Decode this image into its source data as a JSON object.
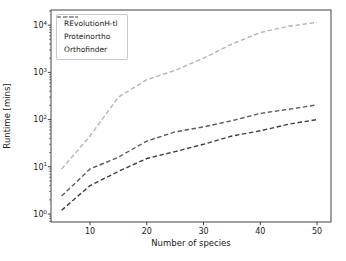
{
  "figure": {
    "background": "#ffffff",
    "frame_color": "#2f2f2f",
    "text_color": "#1a1a1a"
  },
  "chart_data": {
    "type": "line",
    "title": "",
    "xlabel": "Number of species",
    "ylabel": "Runtime [mins]",
    "y_scale": "log",
    "line_style": "dashed",
    "grid": false,
    "x": [
      5,
      10,
      15,
      20,
      25,
      30,
      35,
      40,
      45,
      50
    ],
    "series": [
      {
        "name": "REvolutionH-tl",
        "color": "#3e3e3e",
        "values": [
          1.2,
          4,
          8,
          15,
          21,
          30,
          45,
          58,
          80,
          100
        ]
      },
      {
        "name": "Proteinortho",
        "color": "#5c5c5c",
        "values": [
          2.4,
          9,
          16,
          35,
          55,
          70,
          95,
          135,
          165,
          205
        ]
      },
      {
        "name": "Orthofinder",
        "color": "#b3b7ae",
        "values": [
          9,
          45,
          300,
          700,
          1100,
          2000,
          4000,
          7000,
          9500,
          11500
        ]
      }
    ],
    "x_ticks": [
      10,
      20,
      30,
      40,
      50
    ],
    "x_tick_labels": [
      "10",
      "20",
      "30",
      "40",
      "50"
    ],
    "y_tick_base": "10",
    "y_tick_exponents": [
      "0",
      "1",
      "2",
      "3",
      "4"
    ],
    "xlim": [
      3.1,
      52.5
    ],
    "ylim": [
      0.68,
      21000
    ],
    "legend_position": "upper left"
  }
}
